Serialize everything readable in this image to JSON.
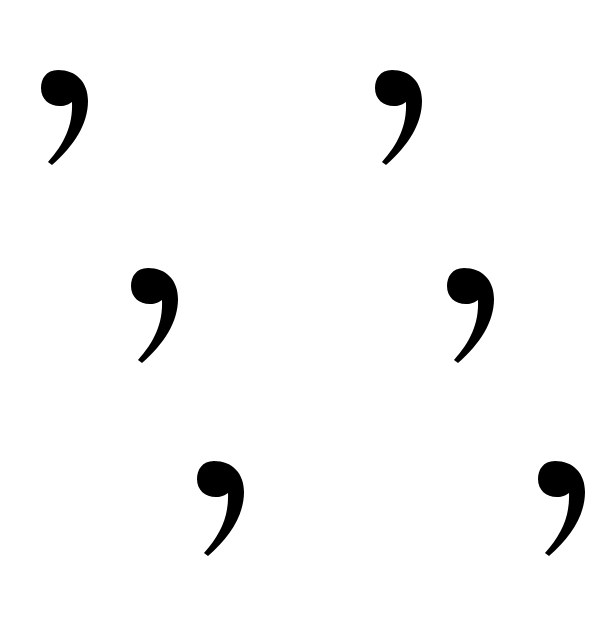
{
  "page": {
    "background_color": "#ffffff",
    "glyph_color": "#000000",
    "glyph": ",",
    "glyph_name": "comma",
    "glyph_count": 6
  },
  "glyphs": [
    {
      "label": "comma",
      "row": 1,
      "column": 1
    },
    {
      "label": "comma",
      "row": 1,
      "column": 2
    },
    {
      "label": "comma",
      "row": 2,
      "column": 1
    },
    {
      "label": "comma",
      "row": 2,
      "column": 2
    },
    {
      "label": "comma",
      "row": 3,
      "column": 1
    },
    {
      "label": "comma",
      "row": 3,
      "column": 2
    }
  ]
}
